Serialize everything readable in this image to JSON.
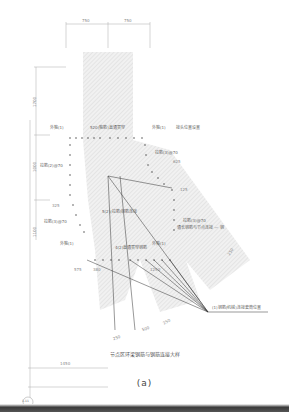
{
  "drawing": {
    "title": "节点区环梁钢筋与钢筋连接大样",
    "subtitle": "(a)",
    "axis_bubble": "1-11",
    "dimensions": {
      "top_left": "750",
      "top_right": "750",
      "left_upper": "1700",
      "left_middle": "1000",
      "left_lower": "1100",
      "left_small_1": "325",
      "bottom_width": "1450",
      "seg_a": "575",
      "seg_b": "380",
      "seg_c": "1250",
      "right_1": "625",
      "right_2": "125",
      "diag_1": "250",
      "diag_2": "500",
      "diag_3": "250",
      "diag_4": "250"
    },
    "labels": {
      "upper_left": "外箍(1)",
      "upper_center": "520(箍筋)直通贯穿",
      "upper_right": "外箍(1)",
      "upper_right_note": "接头位置设置",
      "left_1": "拉筋(2)@70",
      "left_2": "拉筋(3)@70",
      "right_1": "拉筋(3)@70",
      "center_mid": "5(2)(拉筋)钢筋连接",
      "right_mid": "拉筋(3)@70",
      "right_mid_2": "通长钢筋与节点连接 — 钢",
      "lower_left": "外箍(1)",
      "lower_center": "4(2)直通贯穿钢筋",
      "lower_right": "外箍(1)",
      "leader_note": "(1)钢筋(机械)连接套筒位置"
    }
  }
}
